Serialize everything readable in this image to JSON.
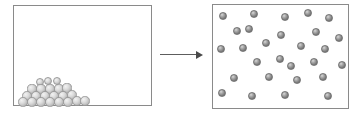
{
  "diagram": {
    "title": "",
    "background_color": "#ffffff",
    "arrow": {
      "name": "transformation-arrow",
      "label": "",
      "direction": "right",
      "color": "#5d5d5d"
    },
    "panels": [
      {
        "id": "solid-state-panel",
        "label": "",
        "border_color": "#8a8a8a",
        "fill_color": "#ffffff",
        "particle_color": "#dcdcdc",
        "particle_count": 16,
        "arrangement": "close-packed-pyramid",
        "particles": [
          {
            "cx": 26,
            "cy": 76,
            "r": 4.4
          },
          {
            "cx": 34,
            "cy": 75,
            "r": 4.4
          },
          {
            "cx": 43,
            "cy": 75,
            "r": 4.4
          },
          {
            "cx": 18,
            "cy": 83,
            "r": 4.6
          },
          {
            "cx": 27,
            "cy": 83,
            "r": 4.6
          },
          {
            "cx": 36,
            "cy": 83,
            "r": 4.6
          },
          {
            "cx": 45,
            "cy": 83,
            "r": 4.6
          },
          {
            "cx": 53,
            "cy": 82,
            "r": 4.6
          },
          {
            "cx": 13,
            "cy": 90,
            "r": 4.7
          },
          {
            "cx": 22,
            "cy": 90,
            "r": 4.7
          },
          {
            "cx": 31,
            "cy": 90,
            "r": 4.7
          },
          {
            "cx": 40,
            "cy": 90,
            "r": 4.7
          },
          {
            "cx": 49,
            "cy": 90,
            "r": 4.7
          },
          {
            "cx": 58,
            "cy": 89,
            "r": 4.7
          },
          {
            "cx": 9,
            "cy": 96,
            "r": 4.7
          },
          {
            "cx": 18,
            "cy": 96,
            "r": 4.7
          },
          {
            "cx": 27,
            "cy": 96,
            "r": 4.7
          },
          {
            "cx": 36,
            "cy": 96,
            "r": 4.7
          },
          {
            "cx": 45,
            "cy": 96,
            "r": 4.7
          },
          {
            "cx": 54,
            "cy": 96,
            "r": 4.7
          },
          {
            "cx": 63,
            "cy": 95,
            "r": 4.7
          },
          {
            "cx": 71,
            "cy": 95,
            "r": 4.7
          }
        ]
      },
      {
        "id": "gas-state-panel",
        "label": "",
        "border_color": "#8a8a8a",
        "fill_color": "#ffffff",
        "particle_color": "#8a8a8a",
        "particle_count": 25,
        "arrangement": "randomly-dispersed",
        "particles": [
          {
            "cx": 10,
            "cy": 11,
            "r": 3.9
          },
          {
            "cx": 41,
            "cy": 9,
            "r": 3.9
          },
          {
            "cx": 72,
            "cy": 12,
            "r": 3.9
          },
          {
            "cx": 95,
            "cy": 8,
            "r": 3.9
          },
          {
            "cx": 116,
            "cy": 13,
            "r": 3.9
          },
          {
            "cx": 24,
            "cy": 26,
            "r": 3.9
          },
          {
            "cx": 36,
            "cy": 24,
            "r": 3.9
          },
          {
            "cx": 68,
            "cy": 30,
            "r": 3.9
          },
          {
            "cx": 103,
            "cy": 27,
            "r": 3.9
          },
          {
            "cx": 126,
            "cy": 33,
            "r": 3.9
          },
          {
            "cx": 8,
            "cy": 44,
            "r": 3.9
          },
          {
            "cx": 30,
            "cy": 43,
            "r": 3.9
          },
          {
            "cx": 53,
            "cy": 38,
            "r": 3.9
          },
          {
            "cx": 88,
            "cy": 41,
            "r": 3.9
          },
          {
            "cx": 112,
            "cy": 44,
            "r": 3.9
          },
          {
            "cx": 44,
            "cy": 57,
            "r": 3.9
          },
          {
            "cx": 67,
            "cy": 54,
            "r": 3.9
          },
          {
            "cx": 78,
            "cy": 61,
            "r": 3.9
          },
          {
            "cx": 101,
            "cy": 57,
            "r": 3.9
          },
          {
            "cx": 129,
            "cy": 60,
            "r": 3.9
          },
          {
            "cx": 21,
            "cy": 73,
            "r": 3.9
          },
          {
            "cx": 56,
            "cy": 72,
            "r": 3.9
          },
          {
            "cx": 84,
            "cy": 75,
            "r": 3.9
          },
          {
            "cx": 110,
            "cy": 72,
            "r": 3.9
          },
          {
            "cx": 9,
            "cy": 88,
            "r": 3.9
          },
          {
            "cx": 39,
            "cy": 91,
            "r": 3.9
          },
          {
            "cx": 72,
            "cy": 90,
            "r": 3.9
          },
          {
            "cx": 115,
            "cy": 91,
            "r": 3.9
          }
        ]
      }
    ]
  }
}
